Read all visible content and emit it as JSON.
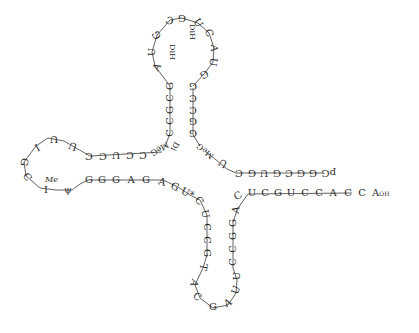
{
  "diagram": {
    "bond_color": "#3a3a3a",
    "text_color": "#2a2a2a",
    "acceptor_5prime": {
      "terminus_label": "pG",
      "bases": [
        "G",
        "G",
        "C",
        "G",
        "U",
        "G",
        "C",
        "U"
      ]
    },
    "acceptor_3prime": {
      "bases": [
        "C",
        "U",
        "C",
        "G",
        "U",
        "C",
        "C",
        "A",
        "C",
        "C"
      ],
      "terminus_base": "A",
      "terminus_sub": "OH"
    },
    "d_arm": {
      "mod_base_5": "MeG",
      "stem_5": [
        "G",
        "C",
        "G",
        "C",
        "C",
        "G"
      ],
      "loop": [
        "G",
        "U",
        "A",
        "C",
        "U",
        "G",
        "C",
        "G",
        "G",
        "U",
        "A"
      ],
      "dihydro_label_1": "DiH",
      "dihydro_label_2": "DiH",
      "stem_3": [
        "G",
        "C",
        "C",
        "G",
        "G"
      ],
      "mod_base_3": "MeG",
      "dihydro_label_3": "Di"
    },
    "anticodon_arm": {
      "stem_5": [
        "C",
        "U",
        "C",
        "C",
        "G",
        "G"
      ],
      "loop": [
        "T",
        "A",
        "C",
        "G",
        "A",
        "U"
      ],
      "stem_3": [
        "U",
        "C",
        "C",
        "G",
        "G",
        "A"
      ],
      "modified_U": "U*"
    },
    "t_arm": {
      "stem_top": [
        "C",
        "C",
        "U",
        "C",
        "C"
      ],
      "loop": [
        "U",
        "U",
        "I",
        "G",
        "C",
        "I"
      ],
      "me_label": "Me",
      "psi": "ψ",
      "stem_bottom": [
        "G",
        "G",
        "G",
        "A",
        "G",
        "A",
        "G"
      ]
    }
  }
}
